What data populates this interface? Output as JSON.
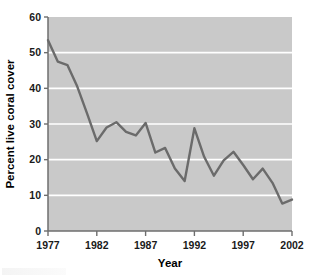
{
  "chart_data": {
    "type": "line",
    "title": "",
    "subtitle": "",
    "xlabel": "Year",
    "ylabel": "Percent live coral cover",
    "xlim": [
      1977,
      2002
    ],
    "ylim": [
      0,
      60
    ],
    "grid": "horizontal",
    "legend": "none",
    "gridlines_y": [
      10,
      20,
      30,
      40,
      50
    ],
    "xticks": [
      1977,
      1982,
      1987,
      1992,
      1997,
      2002
    ],
    "xtick_labels": [
      "1977",
      "1982",
      "1987",
      "1992",
      "1997",
      "2002"
    ],
    "yticks": [
      0,
      10,
      20,
      30,
      40,
      50,
      60
    ],
    "ytick_labels": [
      "0",
      "10",
      "20",
      "30",
      "40",
      "50",
      "60"
    ],
    "x": [
      1977,
      1978,
      1979,
      1980,
      1981,
      1982,
      1983,
      1984,
      1985,
      1986,
      1987,
      1988,
      1989,
      1990,
      1991,
      1992,
      1993,
      1994,
      1995,
      1996,
      1997,
      1998,
      1999,
      2000,
      2001,
      2002
    ],
    "values": [
      53.5,
      47.5,
      46.5,
      40.5,
      33.0,
      25.2,
      29.0,
      30.5,
      27.8,
      26.8,
      30.3,
      22.0,
      23.3,
      17.5,
      14.0,
      28.8,
      20.8,
      15.5,
      19.8,
      22.2,
      18.5,
      14.5,
      17.5,
      13.5,
      7.7,
      8.8
    ],
    "series": [
      {
        "name": "Percent live coral cover",
        "color": "#6b6b6b",
        "values": [
          53.5,
          47.5,
          46.5,
          40.5,
          33.0,
          25.2,
          29.0,
          30.5,
          27.8,
          26.8,
          30.3,
          22.0,
          23.3,
          17.5,
          14.0,
          28.8,
          20.8,
          15.5,
          19.8,
          22.2,
          18.5,
          14.5,
          17.5,
          13.5,
          7.7,
          8.8
        ]
      }
    ],
    "colors": {
      "plot_background": "#c9c9c9",
      "gridline": "#ffffff",
      "line": "#6b6b6b",
      "axis": "#6e6e6e",
      "text": "#000000",
      "page_background": "#ffffff"
    }
  }
}
